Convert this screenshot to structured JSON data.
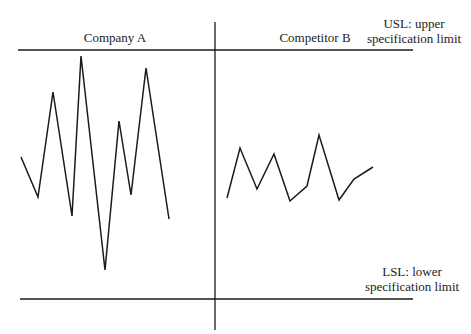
{
  "diagram": {
    "panels": [
      {
        "label": "Company A"
      },
      {
        "label": "Competitor B"
      }
    ],
    "usl": {
      "line1": "USL: upper",
      "line2": "specification limit"
    },
    "lsl": {
      "line1": "LSL: lower",
      "line2": "specification limit"
    },
    "colors": {
      "line": "#1a1a1a",
      "text": "#222222",
      "background": "#ffffff"
    }
  },
  "chart_data": {
    "type": "line",
    "title": "",
    "xlabel": "",
    "ylabel": "",
    "annotations": [
      "USL: upper specification limit",
      "LSL: lower specification limit"
    ],
    "series": [
      {
        "name": "Company A",
        "points_px": [
          [
            21,
            157
          ],
          [
            38,
            197
          ],
          [
            53,
            92
          ],
          [
            72,
            216
          ],
          [
            81,
            56
          ],
          [
            105,
            270
          ],
          [
            119,
            121
          ],
          [
            131,
            195
          ],
          [
            146,
            68
          ],
          [
            169,
            219
          ]
        ]
      },
      {
        "name": "Competitor B",
        "points_px": [
          [
            227,
            198
          ],
          [
            240,
            148
          ],
          [
            257,
            189
          ],
          [
            274,
            154
          ],
          [
            290,
            201
          ],
          [
            307,
            186
          ],
          [
            319,
            135
          ],
          [
            339,
            200
          ],
          [
            354,
            179
          ],
          [
            373,
            167
          ]
        ]
      }
    ],
    "reference_lines": [
      {
        "name": "USL",
        "y_px": 50
      },
      {
        "name": "LSL",
        "y_px": 299
      }
    ],
    "grid": false,
    "legend": "none"
  }
}
